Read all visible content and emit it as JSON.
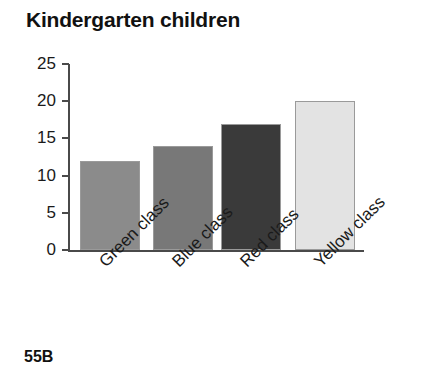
{
  "page": {
    "title": "Kindergarten children",
    "footer_code": "55B",
    "background_color": "#ffffff"
  },
  "chart_data": {
    "type": "bar",
    "title": "Kindergarten children",
    "xlabel": "",
    "ylabel": "",
    "categories": [
      "Green class",
      "Blue class",
      "Red class",
      "Yellow class"
    ],
    "values": [
      12,
      14,
      17,
      20
    ],
    "ylim": [
      0,
      25
    ],
    "ytick_labels": [
      "0",
      "5",
      "10",
      "15",
      "20",
      "25"
    ],
    "ytick_values": [
      0,
      5,
      10,
      15,
      20,
      25
    ],
    "grid": false,
    "legend": "none",
    "xtick_label_rotation": -45,
    "bar_colors": [
      "#8b8b8b",
      "#787878",
      "#3a3a3a",
      "#e3e3e3"
    ],
    "bar_edge_color": "#9a9a9a",
    "axis_color": "#4a4a4a"
  }
}
